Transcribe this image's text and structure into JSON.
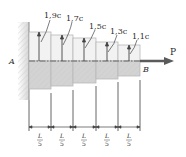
{
  "diagram": {
    "type": "stepped-shaft-axial-load",
    "support_label": "A",
    "free_end_label": "B",
    "load_label": "P",
    "segments": [
      {
        "index": 1,
        "label": "1,9c",
        "length_label_num": "L",
        "length_label_den": "5"
      },
      {
        "index": 2,
        "label": "1,7c",
        "length_label_num": "L",
        "length_label_den": "5"
      },
      {
        "index": 3,
        "label": "1,5c",
        "length_label_num": "L",
        "length_label_den": "5"
      },
      {
        "index": 4,
        "label": "1,3c",
        "length_label_num": "L",
        "length_label_den": "5"
      },
      {
        "index": 5,
        "label": "1,1c",
        "length_label_num": "L",
        "length_label_den": "5"
      }
    ]
  },
  "colors": {
    "wall": "#dcdcdc",
    "upper_fill": "#f1f1f1",
    "lower_fill": "#cfcfcf",
    "line": "#555555",
    "arrow": "#5a5a5a"
  }
}
